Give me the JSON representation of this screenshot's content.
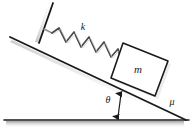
{
  "figure": {
    "background_color": "#ffffff",
    "line_color": "#1a1a1a",
    "shadow_color": "#b8b8b8",
    "width": 193,
    "height": 133
  },
  "labels": {
    "spring_constant": "k",
    "mass": "m",
    "friction_coefficient": "μ",
    "incline_angle": "θ"
  },
  "geometry": {
    "ground_line": {
      "x1": 4,
      "y1": 120,
      "x2": 189,
      "y2": 120
    },
    "incline_line": {
      "x1": 10,
      "y1": 37,
      "x2": 186,
      "y2": 120
    },
    "wall_line": {
      "x1": 53,
      "y1": 3,
      "x2": 39,
      "y2": 43
    },
    "spring": {
      "x1": 46,
      "y1": 31,
      "x2": 118,
      "y2": 65,
      "coils": 6
    },
    "block": {
      "top_left": {
        "x": 123,
        "y": 43
      },
      "top_right": {
        "x": 168,
        "y": 61
      },
      "bottom_right": {
        "x": 155,
        "y": 96
      },
      "bottom_left": {
        "x": 111,
        "y": 78
      }
    },
    "angle_arrow": {
      "x1": 117,
      "y1": 119,
      "x2": 121,
      "y2": 92
    }
  }
}
